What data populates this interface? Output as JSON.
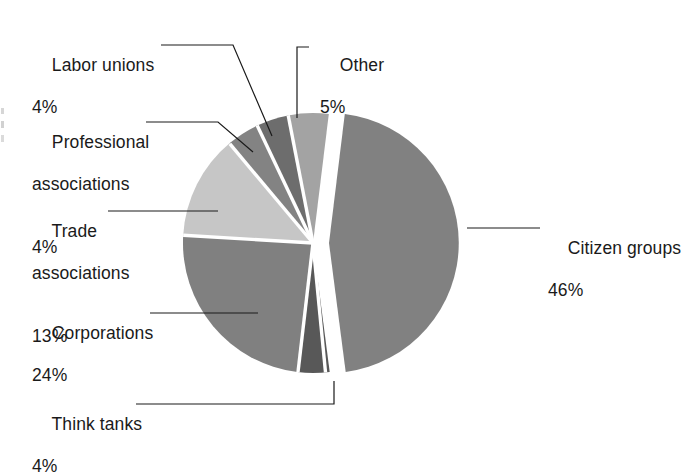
{
  "chart_data": {
    "type": "pie",
    "title": "",
    "subtitle": "",
    "xlabel": "",
    "ylabel": "",
    "legend_position": "callout-labels",
    "grid": false,
    "exploded_slice": "Citizen groups",
    "unit": "%",
    "categories": [
      "Other",
      "Citizen groups",
      "Think tanks",
      "Corporations",
      "Trade associations",
      "Professional associations",
      "Labor unions"
    ],
    "values": [
      5,
      46,
      4,
      24,
      13,
      4,
      4
    ],
    "colors": [
      "#a3a3a3",
      "#818181",
      "#585858",
      "#808080",
      "#c6c6c6",
      "#838383",
      "#6d6d6d"
    ],
    "slices": [
      {
        "label": "Other",
        "value": 5,
        "display": "5%",
        "color": "#a3a3a3",
        "exploded": false
      },
      {
        "label": "Citizen groups",
        "value": 46,
        "display": "46%",
        "color": "#818181",
        "exploded": true
      },
      {
        "label": "Think tanks",
        "value": 4,
        "display": "4%",
        "color": "#585858",
        "exploded": false
      },
      {
        "label": "Corporations",
        "value": 24,
        "display": "24%",
        "color": "#808080",
        "exploded": false
      },
      {
        "label": "Trade associations",
        "value": 13,
        "display": "13%",
        "color": "#c6c6c6",
        "exploded": false
      },
      {
        "label": "Professional associations",
        "value": 4,
        "display": "4%",
        "color": "#838383",
        "exploded": false
      },
      {
        "label": "Labor unions",
        "value": 4,
        "display": "4%",
        "color": "#6d6d6d",
        "exploded": false
      }
    ]
  },
  "callouts": {
    "labor_unions": {
      "name": "Labor unions",
      "pct": "4%"
    },
    "professional_associations": {
      "name_line1": "Professional",
      "name_line2": "associations",
      "pct": "4%"
    },
    "trade_associations": {
      "name_line1": "Trade",
      "name_line2": "associations",
      "pct": "13%"
    },
    "corporations": {
      "name": "Corporations",
      "pct": "24%"
    },
    "think_tanks": {
      "name": "Think tanks",
      "pct": "4%"
    },
    "other": {
      "name": "Other",
      "pct": "5%"
    },
    "citizen_groups": {
      "name": "Citizen groups",
      "pct": "46%"
    }
  }
}
